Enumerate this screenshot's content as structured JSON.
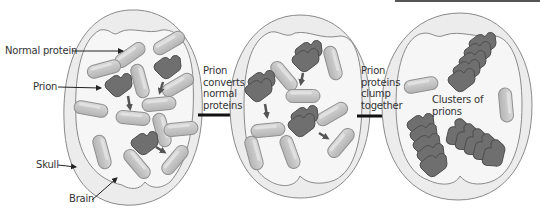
{
  "diagram": {
    "title": "",
    "colors": {
      "skull_fill": "#ececec",
      "skull_stroke": "#8a8a8a",
      "brain_fill": "#f6f6f6",
      "normal_protein_fill": "#c9c9c9",
      "normal_protein_stroke": "#8f8f8f",
      "prion_fill": "#6f6f6f",
      "prion_stroke": "#4f4f4f",
      "arrow_color": "#111111",
      "small_arrow_color": "#555555",
      "text_color": "#333333"
    },
    "panels": [
      {
        "id": "panel-1",
        "description": "Brain with normal proteins and three prions",
        "labels": {
          "normal_protein": "Normal protein",
          "prion": "Prion",
          "skull": "Skull",
          "brain": "Brain"
        }
      },
      {
        "id": "panel-2",
        "description": "Prions converting normal proteins"
      },
      {
        "id": "panel-3",
        "description": "Clusters of prions",
        "labels": {
          "clusters": [
            "Clusters of",
            "prions"
          ]
        }
      }
    ],
    "transitions": [
      {
        "from": "panel-1",
        "to": "panel-2",
        "text": [
          "Prion",
          "converts",
          "normal",
          "proteins"
        ]
      },
      {
        "from": "panel-2",
        "to": "panel-3",
        "text": [
          "Prion",
          "proteins",
          "clump",
          "together"
        ]
      }
    ]
  }
}
